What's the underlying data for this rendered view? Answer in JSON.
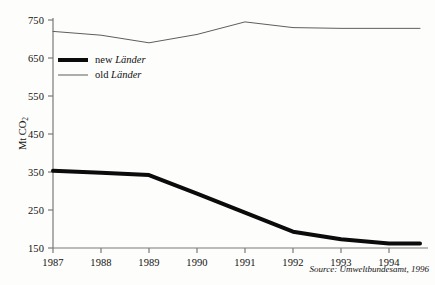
{
  "chart_data": {
    "type": "line",
    "title": "",
    "xlabel": "",
    "ylabel": "Mt CO2",
    "ylabel_base": "Mt CO",
    "ylabel_sub": "2",
    "x": [
      1987,
      1988,
      1989,
      1990,
      1991,
      1992,
      1993,
      1994
    ],
    "xtick_labels": [
      "1987",
      "1988",
      "1989",
      "1990",
      "1991",
      "1992",
      "1993",
      "1994"
    ],
    "ytick_labels": [
      "150",
      "250",
      "350",
      "450",
      "550",
      "650",
      "750"
    ],
    "yticks": [
      150,
      250,
      350,
      450,
      550,
      650,
      750
    ],
    "ylim": [
      150,
      750
    ],
    "xlim": [
      1987,
      1994
    ],
    "grid": false,
    "legend_position": "upper-left-inside",
    "series": [
      {
        "name": "new Länder",
        "name_prefix": "new ",
        "name_emphasis": "Länder",
        "color": "#0b0b0b",
        "line_width": 4,
        "values": [
          353,
          348,
          342,
          293,
          243,
          193,
          173,
          162
        ]
      },
      {
        "name": "old Länder",
        "name_prefix": "old ",
        "name_emphasis": "Länder",
        "color": "#5e5e5e",
        "line_width": 1,
        "values": [
          720,
          710,
          690,
          712,
          745,
          730,
          728,
          728
        ]
      }
    ],
    "annotations": {
      "source": "Source: Umweltbundesamt, 1996"
    }
  },
  "axis": {
    "line_color": "#7a7a7a",
    "tick_color": "#7a7a7a"
  }
}
